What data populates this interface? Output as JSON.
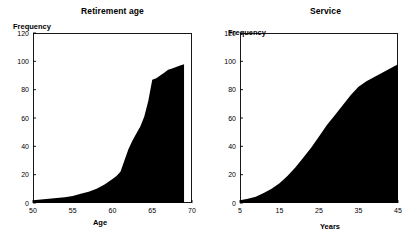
{
  "chart_data": [
    {
      "type": "area",
      "title": "Retirement age",
      "xlabel": "Age",
      "ylabel": "Frequency",
      "xlim": [
        50,
        70
      ],
      "ylim": [
        0,
        120
      ],
      "xticks": [
        50,
        55,
        60,
        65,
        70
      ],
      "yticks": [
        0,
        20,
        40,
        60,
        80,
        100,
        120
      ],
      "grid": false,
      "legend": "none",
      "x": [
        50,
        51,
        52,
        53,
        54,
        55,
        56,
        57,
        58,
        59,
        60,
        60.5,
        61,
        61.5,
        62,
        62.5,
        63,
        63.5,
        64,
        64.5,
        65,
        65.5,
        66,
        66.5,
        67,
        67.5,
        68,
        68.5,
        69
      ],
      "values": [
        2,
        2.5,
        3,
        3.5,
        4,
        5,
        6.5,
        8,
        10,
        13,
        17,
        19,
        22,
        30,
        38,
        44,
        49,
        54,
        61,
        72,
        87,
        88,
        90,
        92,
        94,
        95,
        96,
        97,
        98
      ]
    },
    {
      "type": "area",
      "title": "Service",
      "xlabel": "Years",
      "ylabel": "Frequency",
      "xlim": [
        5,
        45
      ],
      "ylim": [
        0,
        120
      ],
      "xticks": [
        5,
        15,
        25,
        35,
        45
      ],
      "yticks": [
        0,
        20,
        40,
        60,
        80,
        100,
        120
      ],
      "grid": false,
      "legend": "none",
      "x": [
        5,
        7,
        9,
        11,
        13,
        15,
        17,
        19,
        21,
        23,
        25,
        27,
        29,
        31,
        33,
        35,
        37,
        39,
        41,
        43,
        45
      ],
      "values": [
        2,
        3,
        4.5,
        7,
        10,
        14,
        19,
        25,
        32,
        39,
        47,
        55,
        62,
        69,
        76,
        82,
        86,
        89,
        92,
        95,
        98
      ]
    }
  ]
}
